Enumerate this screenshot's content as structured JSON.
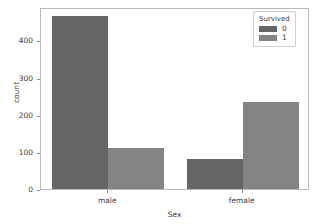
{
  "chart_data": {
    "type": "bar",
    "title": "",
    "subtitle": "",
    "xlabel": "Sex",
    "ylabel": "count",
    "categories": [
      "male",
      "female"
    ],
    "series": [
      {
        "name": "0",
        "values": [
          465,
          80
        ],
        "color": "#656565"
      },
      {
        "name": "1",
        "values": [
          110,
          233
        ],
        "color": "#848484"
      }
    ],
    "legend": {
      "title": "Survived",
      "position": "upper right",
      "entries": [
        "0",
        "1"
      ]
    },
    "xlim": [
      0,
      2
    ],
    "ylim": [
      0,
      490
    ],
    "yticks": [
      0,
      100,
      200,
      300,
      400
    ],
    "ytick_labels": [
      "0",
      "100",
      "200",
      "300",
      "400"
    ],
    "xtick_labels": [
      "male",
      "female"
    ],
    "grid": false,
    "bar_style": "grouped",
    "palette": [
      "#656565",
      "#848484"
    ],
    "background": "#ffffff",
    "frame_color": "#b9b9b9"
  },
  "axes": {
    "y": {
      "label": "count",
      "ticks": [
        {
          "value": 400,
          "label": "400"
        },
        {
          "value": 300,
          "label": "300"
        },
        {
          "value": 200,
          "label": "200"
        },
        {
          "value": 100,
          "label": "100"
        },
        {
          "value": 0,
          "label": "0"
        }
      ]
    },
    "x": {
      "label": "Sex",
      "ticks": [
        {
          "value": 0,
          "label": "male"
        },
        {
          "value": 1,
          "label": "female"
        }
      ]
    }
  },
  "legend": {
    "title": "Survived",
    "items": [
      {
        "label": "0",
        "color": "#656565"
      },
      {
        "label": "1",
        "color": "#848484"
      }
    ]
  }
}
